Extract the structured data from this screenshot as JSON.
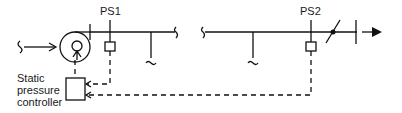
{
  "diagram": {
    "type": "duct-static-pressure-control",
    "labels": {
      "ps1": "PS1",
      "ps2": "PS2",
      "controller_line1": "Static",
      "controller_line2": "pressure",
      "controller_line3": "controller"
    },
    "components": [
      "fan",
      "pressure-sensor-ps1",
      "pressure-sensor-ps2",
      "branch-1",
      "branch-2",
      "damper",
      "static-pressure-controller"
    ],
    "colors": {
      "line": "#111111",
      "background": "#ffffff"
    }
  }
}
